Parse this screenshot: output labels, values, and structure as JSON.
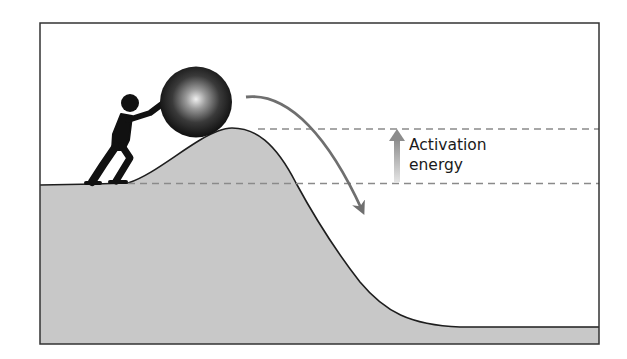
{
  "diagram": {
    "label": {
      "line1": "Activation",
      "line2": "energy"
    },
    "elements": {
      "frame": "rectangle-border",
      "hill": "energy-landscape-hill",
      "ball": "boulder-sphere",
      "person": "person-pushing-silhouette",
      "roll_arrow": "curved-downhill-arrow",
      "activation_arrow": "upward-gradient-arrow",
      "upper_dashed": "transition-state-level",
      "lower_dashed": "starting-energy-level"
    },
    "colors": {
      "hill_fill": "#c8c8c8",
      "outline": "#1e1e1e",
      "arrow": "#6f6f6f",
      "dashed": "#8a8a8a",
      "ball_dark": "#111111",
      "ball_highlight": "#f2f2f2",
      "frame": "#333333"
    }
  }
}
